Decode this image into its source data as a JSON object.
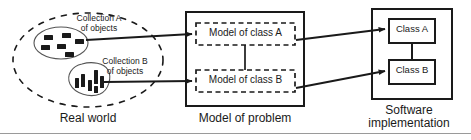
{
  "diagram": {
    "type": "block-diagram",
    "background_color": "#ffffff",
    "line_color": "#1a1a1a",
    "text_color": "#1a1a1a"
  },
  "panels": {
    "real_world": {
      "caption": "Real world",
      "cloud_style": "dashed-ellipse",
      "collections": [
        {
          "id": "collection-a",
          "label_line1": "Collection A",
          "label_line2": "of objects",
          "shape": "ellipse",
          "object_count": 6,
          "object_style": "small-horizontal-rectangles",
          "object_color": "#1a1a1a"
        },
        {
          "id": "collection-b",
          "label_line1": "Collection B",
          "label_line2": "of objects",
          "shape": "blob",
          "object_count": 6,
          "object_style": "vertical-bars",
          "object_color": "#1a1a1a"
        }
      ]
    },
    "model_of_problem": {
      "caption": "Model of problem",
      "border_style": "solid",
      "inner_boxes": [
        {
          "id": "model-class-a",
          "label": "Model of class A",
          "border_style": "dashed"
        },
        {
          "id": "model-class-b",
          "label": "Model of class B",
          "border_style": "dashed"
        }
      ],
      "association": "vertical-line-between-model-a-and-model-b"
    },
    "software_implementation": {
      "caption_line1": "Software",
      "caption_line2": "implementation",
      "border_style": "solid",
      "inner_boxes": [
        {
          "id": "class-a",
          "label": "Class A",
          "border_style": "solid"
        },
        {
          "id": "class-b",
          "label": "Class B",
          "border_style": "solid"
        }
      ],
      "association": "vertical-line-between-class-a-and-class-b"
    }
  },
  "arrows": [
    {
      "id": "arrow-collection-a-to-model-a",
      "from": "collection-a",
      "to": "model-class-a",
      "head": "filled-triangle"
    },
    {
      "id": "arrow-collection-b-to-model-b",
      "from": "collection-b",
      "to": "model-class-b",
      "head": "filled-triangle"
    },
    {
      "id": "arrow-model-a-to-class-a",
      "from": "model-class-a",
      "to": "class-a",
      "head": "filled-triangle"
    },
    {
      "id": "arrow-model-b-to-class-b",
      "from": "model-class-b",
      "to": "class-b",
      "head": "filled-triangle"
    }
  ]
}
